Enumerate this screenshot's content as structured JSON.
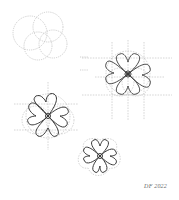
{
  "artwork": {
    "type": "pencil construction sketch",
    "description": "Four stages of a four-petal flower construction drawing",
    "signature": "DF 2022",
    "stroke_light": "#a8a8a8",
    "stroke_dark": "#3a3a3a",
    "background": "#ffffff",
    "figures": [
      {
        "id": "stage-1",
        "cx": 42,
        "cy": 38,
        "stage": "guide circles only"
      },
      {
        "id": "stage-2",
        "cx": 128,
        "cy": 77,
        "stage": "circles, grid lines and inked petals"
      },
      {
        "id": "stage-3",
        "cx": 48,
        "cy": 114,
        "stage": "inked petals with guides"
      },
      {
        "id": "stage-4",
        "cx": 100,
        "cy": 157,
        "stage": "inked petals with outer lobes"
      }
    ]
  }
}
